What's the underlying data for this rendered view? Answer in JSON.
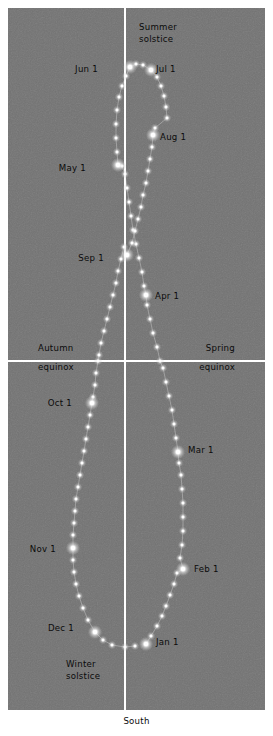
{
  "figure": {
    "type": "analemma-diagram",
    "background_color": "#737373",
    "axis_color": "#ffffff",
    "sun_color": "#ffffff",
    "label_color": "#0b0b0b",
    "bottom_label": "South"
  },
  "axes": {
    "meridian_label": "South",
    "horizontal_line_label_left_1": "Autumn",
    "horizontal_line_label_left_2": "equinox",
    "horizontal_line_label_right_1": "Spring",
    "horizontal_line_label_right_2": "equinox"
  },
  "annotations": [
    {
      "id": "summer-solstice",
      "line1": "Summer",
      "line2": "solstice"
    },
    {
      "id": "winter-solstice",
      "line1": "Winter",
      "line2": "solstice"
    },
    {
      "id": "autumn-equinox",
      "line1": "Autumn",
      "line2": "equinox"
    },
    {
      "id": "spring-equinox",
      "line1": "Spring",
      "line2": "equinox"
    }
  ],
  "month_markers": [
    {
      "label": "Jan 1",
      "x": 146,
      "y": 644
    },
    {
      "label": "Feb 1",
      "x": 183,
      "y": 569
    },
    {
      "label": "Mar 1",
      "x": 178,
      "y": 452
    },
    {
      "label": "Apr 1",
      "x": 146,
      "y": 295
    },
    {
      "label": "May 1",
      "x": 118,
      "y": 165
    },
    {
      "label": "Jun 1",
      "x": 130,
      "y": 67
    },
    {
      "label": "Jul 1",
      "x": 151,
      "y": 70
    },
    {
      "label": "Aug 1",
      "x": 153,
      "y": 135
    },
    {
      "label": "Sep 1",
      "x": 127,
      "y": 255
    },
    {
      "label": "Oct 1",
      "x": 92,
      "y": 403
    },
    {
      "label": "Nov 1",
      "x": 73,
      "y": 548
    },
    {
      "label": "Dec 1",
      "x": 95,
      "y": 632
    }
  ],
  "chart_data": {
    "type": "scatter",
    "title": "",
    "subtitle": "",
    "xlabel": "South",
    "ylabel": "",
    "grid": false,
    "legend": null,
    "axis_lines": [
      {
        "name": "meridian",
        "orientation": "vertical",
        "x": 125
      },
      {
        "name": "equinox",
        "orientation": "horizontal",
        "y": 361
      }
    ],
    "series": [
      {
        "name": "Sun positions (every ~3 days)",
        "marker": "glowing-dot",
        "points": [
          [
            146,
            644
          ],
          [
            151,
            636
          ],
          [
            157,
            626
          ],
          [
            162,
            616
          ],
          [
            166,
            606
          ],
          [
            170,
            595
          ],
          [
            174,
            584
          ],
          [
            177,
            573
          ],
          [
            183,
            569
          ],
          [
            180,
            558
          ],
          [
            182,
            545
          ],
          [
            183,
            531
          ],
          [
            183,
            517
          ],
          [
            183,
            503
          ],
          [
            182,
            489
          ],
          [
            181,
            475
          ],
          [
            179,
            463
          ],
          [
            178,
            452
          ],
          [
            176,
            438
          ],
          [
            174,
            424
          ],
          [
            172,
            410
          ],
          [
            169,
            396
          ],
          [
            166,
            382
          ],
          [
            163,
            368
          ],
          [
            160,
            361
          ],
          [
            157,
            347
          ],
          [
            153,
            333
          ],
          [
            150,
            319
          ],
          [
            147,
            305
          ],
          [
            146,
            295
          ],
          [
            144,
            286
          ],
          [
            142,
            272
          ],
          [
            139,
            258
          ],
          [
            136,
            244
          ],
          [
            133,
            230
          ],
          [
            131,
            216
          ],
          [
            129,
            202
          ],
          [
            127,
            188
          ],
          [
            125,
            174
          ],
          [
            122,
            166
          ],
          [
            118,
            165
          ],
          [
            117,
            152
          ],
          [
            116,
            138
          ],
          [
            116,
            124
          ],
          [
            117,
            110
          ],
          [
            119,
            97
          ],
          [
            122,
            86
          ],
          [
            126,
            76
          ],
          [
            130,
            67
          ],
          [
            136,
            64
          ],
          [
            143,
            65
          ],
          [
            151,
            70
          ],
          [
            157,
            77
          ],
          [
            161,
            86
          ],
          [
            164,
            96
          ],
          [
            166,
            107
          ],
          [
            167,
            118
          ],
          [
            155,
            128
          ],
          [
            153,
            135
          ],
          [
            152,
            147
          ],
          [
            150,
            159
          ],
          [
            148,
            171
          ],
          [
            146,
            183
          ],
          [
            143,
            195
          ],
          [
            141,
            207
          ],
          [
            138,
            219
          ],
          [
            135,
            231
          ],
          [
            132,
            243
          ],
          [
            127,
            255
          ],
          [
            124,
            247
          ],
          [
            121,
            259
          ],
          [
            118,
            271
          ],
          [
            116,
            283
          ],
          [
            113,
            295
          ],
          [
            110,
            307
          ],
          [
            107,
            319
          ],
          [
            104,
            331
          ],
          [
            101,
            343
          ],
          [
            99,
            355
          ],
          [
            98,
            361
          ],
          [
            96,
            373
          ],
          [
            95,
            385
          ],
          [
            93,
            397
          ],
          [
            92,
            403
          ],
          [
            90,
            415
          ],
          [
            88,
            427
          ],
          [
            86,
            439
          ],
          [
            84,
            451
          ],
          [
            82,
            463
          ],
          [
            80,
            475
          ],
          [
            78,
            487
          ],
          [
            76,
            499
          ],
          [
            75,
            511
          ],
          [
            74,
            523
          ],
          [
            73,
            535
          ],
          [
            73,
            548
          ],
          [
            73,
            560
          ],
          [
            74,
            572
          ],
          [
            76,
            584
          ],
          [
            79,
            596
          ],
          [
            83,
            608
          ],
          [
            88,
            620
          ],
          [
            95,
            632
          ],
          [
            103,
            640
          ],
          [
            112,
            645
          ],
          [
            125,
            647
          ],
          [
            135,
            646
          ]
        ]
      }
    ],
    "month_marker_points": [
      {
        "month": "Jan 1",
        "x": 146,
        "y": 644
      },
      {
        "month": "Feb 1",
        "x": 183,
        "y": 569
      },
      {
        "month": "Mar 1",
        "x": 178,
        "y": 452
      },
      {
        "month": "Apr 1",
        "x": 146,
        "y": 295
      },
      {
        "month": "May 1",
        "x": 118,
        "y": 165
      },
      {
        "month": "Jun 1",
        "x": 130,
        "y": 67
      },
      {
        "month": "Jul 1",
        "x": 151,
        "y": 70
      },
      {
        "month": "Aug 1",
        "x": 153,
        "y": 135
      },
      {
        "month": "Sep 1",
        "x": 127,
        "y": 255
      },
      {
        "month": "Oct 1",
        "x": 92,
        "y": 403
      },
      {
        "month": "Nov 1",
        "x": 73,
        "y": 548
      },
      {
        "month": "Dec 1",
        "x": 95,
        "y": 632
      }
    ]
  },
  "labels": {
    "summer_solstice_1": "Summer",
    "summer_solstice_2": "solstice",
    "winter_solstice_1": "Winter",
    "winter_solstice_2": "solstice",
    "autumn_1": "Autumn",
    "autumn_2": "equinox",
    "spring_1": "Spring",
    "spring_2": "equinox",
    "jan": "Jan 1",
    "feb": "Feb 1",
    "mar": "Mar 1",
    "apr": "Apr 1",
    "may": "May 1",
    "jun": "Jun 1",
    "jul": "Jul 1",
    "aug": "Aug 1",
    "sep": "Sep 1",
    "oct": "Oct 1",
    "nov": "Nov 1",
    "dec": "Dec 1",
    "south": "South"
  }
}
